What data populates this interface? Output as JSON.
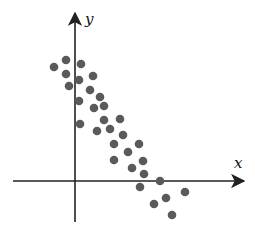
{
  "chart_data": {
    "type": "scatter",
    "title": "",
    "xlabel": "x",
    "ylabel": "y",
    "grid": false,
    "legend": null,
    "note": "No tick marks or numeric labels shown; values are relative to the origin (x right, y up) in screen-pixel units.",
    "origin_px": [
      75,
      181
    ],
    "points": [
      {
        "x": -21,
        "y": 114
      },
      {
        "x": -9,
        "y": 121
      },
      {
        "x": 6,
        "y": 117
      },
      {
        "x": -9,
        "y": 107
      },
      {
        "x": 18,
        "y": 105
      },
      {
        "x": 4,
        "y": 101
      },
      {
        "x": -6,
        "y": 95
      },
      {
        "x": 15,
        "y": 91
      },
      {
        "x": 25,
        "y": 84
      },
      {
        "x": 4,
        "y": 80
      },
      {
        "x": 19,
        "y": 73
      },
      {
        "x": 29,
        "y": 75
      },
      {
        "x": 5,
        "y": 57
      },
      {
        "x": 29,
        "y": 61
      },
      {
        "x": 45,
        "y": 62
      },
      {
        "x": 22,
        "y": 50
      },
      {
        "x": 35,
        "y": 52
      },
      {
        "x": 48,
        "y": 46
      },
      {
        "x": 39,
        "y": 37
      },
      {
        "x": 64,
        "y": 37
      },
      {
        "x": 53,
        "y": 29
      },
      {
        "x": 39,
        "y": 21
      },
      {
        "x": 68,
        "y": 20
      },
      {
        "x": 57,
        "y": 13
      },
      {
        "x": 69,
        "y": 7
      },
      {
        "x": 85,
        "y": 0
      },
      {
        "x": 65,
        "y": -6
      },
      {
        "x": 110,
        "y": -11
      },
      {
        "x": 91,
        "y": -17
      },
      {
        "x": 79,
        "y": -23
      },
      {
        "x": 97,
        "y": -34
      }
    ],
    "trend": "negative linear correlation"
  },
  "style": {
    "point_color": "#5a5a5a",
    "axis_color": "#222222",
    "point_radius": 4.3
  },
  "labels": {
    "x_axis": "x",
    "y_axis": "y"
  }
}
